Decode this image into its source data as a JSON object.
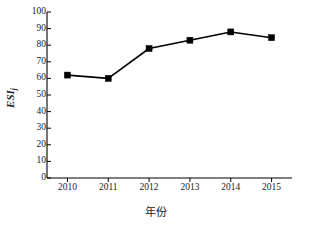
{
  "chart_data": {
    "type": "line",
    "title": "",
    "subtitle": "",
    "xlabel": "年份",
    "ylabel": "ESI",
    "ylabel_subscript": "j",
    "categories": [
      "2010",
      "2011",
      "2012",
      "2013",
      "2014",
      "2015"
    ],
    "x": [
      2010,
      2011,
      2012,
      2013,
      2014,
      2015
    ],
    "values": [
      62,
      60,
      78,
      83,
      88,
      84.5
    ],
    "series": [
      {
        "name": "ESI",
        "values": [
          62,
          60,
          78,
          83,
          88,
          84.5
        ]
      }
    ],
    "ylim": [
      0,
      100
    ],
    "yticks": [
      "0",
      "10",
      "20",
      "30",
      "40",
      "50",
      "60",
      "70",
      "80",
      "90",
      "100"
    ],
    "ytick_values": [
      0,
      10,
      20,
      30,
      40,
      50,
      60,
      70,
      80,
      90,
      100
    ],
    "xticks": [
      "2010",
      "2011",
      "2012",
      "2013",
      "2014",
      "2015"
    ],
    "grid": false,
    "legend": null,
    "legend_position": "none",
    "marker": "filled-square",
    "line_color": "#000000",
    "marker_color": "#000000",
    "axis_color": "#000000",
    "background_color": "#ffffff",
    "annotations": []
  },
  "axes": {
    "y_title": "ESI",
    "y_title_subscript": "j",
    "x_title": "年份"
  }
}
